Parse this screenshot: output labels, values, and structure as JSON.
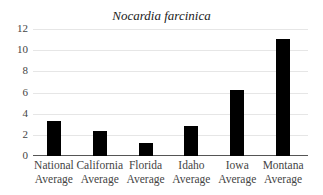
{
  "chart_data": {
    "type": "bar",
    "title": "Nocardia farcinica",
    "xlabel": "",
    "ylabel": "",
    "ylim": [
      0,
      12
    ],
    "yticks": [
      0,
      2,
      4,
      6,
      8,
      10,
      12
    ],
    "grid": true,
    "legend": "none",
    "categories": [
      {
        "line1": "National",
        "line2": "Average"
      },
      {
        "line1": "California",
        "line2": "Average"
      },
      {
        "line1": "Florida",
        "line2": "Average"
      },
      {
        "line1": "Idaho",
        "line2": "Average"
      },
      {
        "line1": "Iowa",
        "line2": "Average"
      },
      {
        "line1": "Montana",
        "line2": "Average"
      }
    ],
    "values": [
      3.3,
      2.4,
      1.2,
      2.8,
      6.2,
      11.1
    ],
    "bar_color": "#000000"
  }
}
